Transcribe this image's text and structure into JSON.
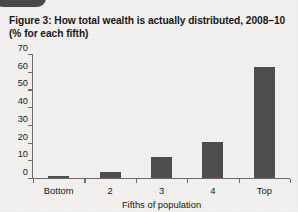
{
  "figure": {
    "title_line1": "Figure 3: How total wealth is actually distributed, 2008–10",
    "title_line2": "(% for each fifth)"
  },
  "colors": {
    "bar": "#4f4e4e",
    "axis": "#6e6c6a",
    "page_background": "#f3f1ef",
    "text": "#171717"
  },
  "chart_data": {
    "type": "bar",
    "title": "Figure 3: How total wealth is actually distributed, 2008–10 (% for each fifth)",
    "categories": [
      "Bottom",
      "2",
      "3",
      "4",
      "Top"
    ],
    "values": [
      1,
      3.5,
      12,
      20.5,
      62.5
    ],
    "xlabel": "Fifths of population",
    "ylabel": "",
    "ylim": [
      0,
      70
    ],
    "yticks": [
      0,
      10,
      20,
      30,
      40,
      50,
      60,
      70
    ],
    "ytick_labels": [
      "0",
      "10",
      "20",
      "30",
      "40",
      "50",
      "60",
      "70"
    ],
    "grid": false,
    "legend": null
  }
}
